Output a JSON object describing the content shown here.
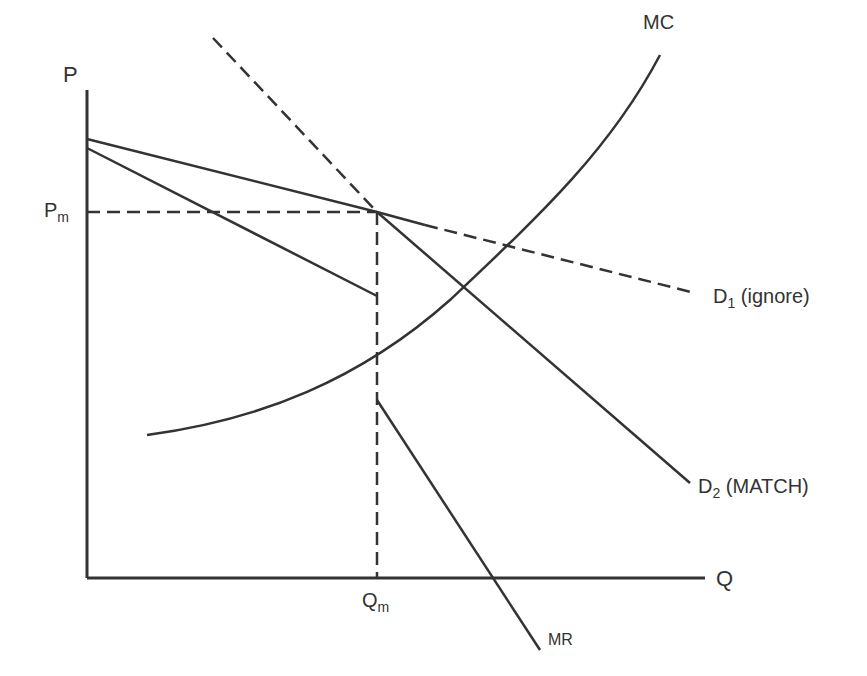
{
  "diagram": {
    "axes": {
      "y_label": "P",
      "x_label": "Q"
    },
    "labels": {
      "pm": {
        "main": "P",
        "sub": "m"
      },
      "qm": {
        "main": "Q",
        "sub": "m"
      },
      "mc": "MC",
      "mr": "MR",
      "d1": {
        "main": "D",
        "sub": "1",
        "suffix": "(ignore)"
      },
      "d2": {
        "main": "D",
        "sub": "2",
        "suffix": "(MATCH)"
      }
    },
    "colors": {
      "line": "#333333",
      "background": "#ffffff"
    },
    "geometry": {
      "origin": [
        87,
        578
      ],
      "y_axis_top": [
        87,
        90
      ],
      "x_axis_end": [
        705,
        578
      ],
      "kink_point": [
        377,
        212
      ],
      "d1_solid": [
        [
          87,
          139
        ],
        [
          377,
          212
        ],
        [
          425,
          225
        ]
      ],
      "d1_dashed": [
        [
          425,
          225
        ],
        [
          695,
          293
        ]
      ],
      "d2_dashed": [
        [
          213,
          38
        ],
        [
          377,
          212
        ]
      ],
      "d2_solid": [
        [
          377,
          212
        ],
        [
          690,
          483
        ]
      ],
      "mr_upper": [
        [
          87,
          148
        ],
        [
          377,
          296
        ]
      ],
      "mr_lower": [
        [
          377,
          400
        ],
        [
          540,
          650
        ]
      ],
      "pm_guide": [
        [
          87,
          212
        ],
        [
          377,
          212
        ]
      ],
      "qm_guide": [
        [
          377,
          212
        ],
        [
          377,
          578
        ]
      ],
      "mc_curve": "M147,435 C260,420 360,380 450,300 C540,215 610,150 660,55"
    }
  }
}
